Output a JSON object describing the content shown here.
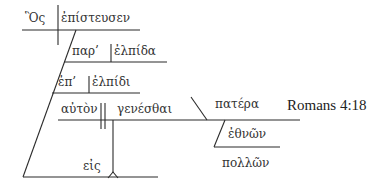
{
  "title": "Romans 4:18",
  "diagram": {
    "reference": "Romans 4:18",
    "words": {
      "subject": "Ὃς",
      "verb": "ἐπίστευσεν",
      "prep1": "παρ’",
      "obj1": "ἐλπίδα",
      "prep2": "ἐπ’",
      "obj2": "ἐλπίδι",
      "inf_subject": "αὐτὸν",
      "infinitive": "γενέσθαι",
      "prep3": "εἰς",
      "predicate": "πατέρα",
      "genitive": "ἐθνῶν",
      "modifier": "πολλῶν"
    },
    "colors": {
      "ink": "#2b2b2b",
      "background": "#ffffff"
    }
  }
}
